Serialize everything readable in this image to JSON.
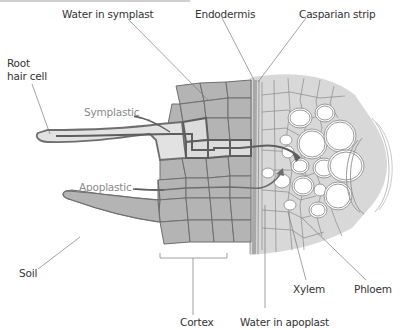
{
  "figure": {
    "labels": {
      "water_in_symplast": "Water in symplast",
      "endodermis": "Endodermis",
      "casparian_strip": "Casparian strip",
      "root_hair_cell": "Root hair cell",
      "root_hair_line1": "Root",
      "root_hair_line2": "hair cell",
      "symplastic": "Symplastic",
      "apoplastic": "Apoplastic",
      "soil": "Soil",
      "cortex": "Cortex",
      "water_in_apoplast": "Water in apoplast",
      "xylem": "Xylem",
      "phloem": "Phloem"
    },
    "colors": {
      "cortex_cell_fill": "#b4b4b4",
      "cortex_cell_border": "#6e6e6e",
      "inner_tissue_fill": "#d8d8d8",
      "inner_tissue_border": "#8a8a8a",
      "root_hair_fill": "#e2e2e2",
      "symplast_path": "#5e5e5e",
      "casparian_strip": "#a8a8a8",
      "vessel_fill": "#ffffff",
      "vessel_border": "#9a9a9a",
      "leader_line": "#7a7a7a",
      "pathway_label": "#8a8a8a",
      "label_text": "#333333"
    }
  }
}
